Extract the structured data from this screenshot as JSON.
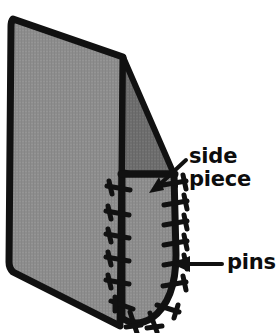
{
  "figure": {
    "kind": "technical-illustration",
    "background_color": "#ffffff",
    "outline_color": "#111111",
    "main_panel_fill": "#8d8d8d",
    "side_piece_fill": "#6e6e6e",
    "pin_color": "#111111",
    "annotations": [
      {
        "id": "side-piece",
        "label_line_1": "side",
        "label_line_2": "piece",
        "text_color": "#0d0d0d",
        "arrow": {
          "from_x": 186,
          "from_y": 160,
          "to_x": 149,
          "to_y": 193
        }
      },
      {
        "id": "pins",
        "label_line_1": "pins",
        "text_color": "#0d0d0d",
        "arrow": {
          "from_x": 222,
          "from_y": 264,
          "to_x": 174,
          "to_y": 264
        }
      }
    ],
    "pin_count_left": 6,
    "pin_count_right": 7,
    "pin_count_bottom": 3
  }
}
